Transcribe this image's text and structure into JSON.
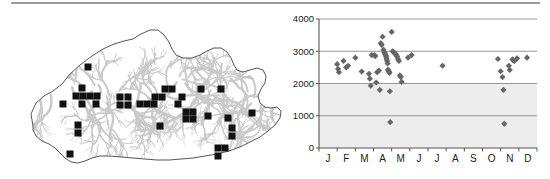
{
  "figure": {
    "panels": [
      "distribution-map",
      "altitude-month-scatter"
    ],
    "background_color": "#ffffff",
    "rule_color": "#9a9a9a"
  },
  "map": {
    "name": "Bhutan distribution map",
    "outline_color": "#555555",
    "relief_color": "#c9c9c9",
    "record_marker_color": "#111111",
    "record_marker_shape": "square",
    "record_marker_size": 7,
    "outline_path": "M 33 118 L 31 106 L 36 95 L 44 88 L 53 83 L 62 76 L 70 66 L 80 57 L 92 48 L 103 41 L 114 36 L 124 33 L 133 31 L 141 26 L 150 22 L 158 22 L 164 27 L 169 34 L 172 41 L 176 47 L 183 50 L 192 50 L 200 47 L 207 43 L 214 40 L 221 40 L 227 44 L 231 50 L 234 57 L 237 62 L 243 64 L 250 62 L 257 60 L 263 62 L 266 68 L 265 75 L 261 81 L 258 88 L 260 95 L 265 99 L 271 100 L 277 99 L 281 103 L 280 110 L 275 117 L 268 123 L 260 129 L 250 134 L 240 139 L 229 143 L 217 146 L 205 148 L 193 150 L 181 151 L 169 152 L 157 152 L 145 151 L 133 150 L 121 149 L 110 148 L 100 148 L 92 150 L 85 153 L 78 155 L 71 154 L 65 150 L 60 145 L 55 140 L 49 136 L 42 133 L 36 128 L 33 122 Z",
    "records": [
      {
        "x": 88,
        "y": 59
      },
      {
        "x": 82,
        "y": 80
      },
      {
        "x": 63,
        "y": 96
      },
      {
        "x": 76,
        "y": 88
      },
      {
        "x": 83,
        "y": 88
      },
      {
        "x": 90,
        "y": 88
      },
      {
        "x": 97,
        "y": 88
      },
      {
        "x": 82,
        "y": 96
      },
      {
        "x": 96,
        "y": 96
      },
      {
        "x": 78,
        "y": 117
      },
      {
        "x": 78,
        "y": 125
      },
      {
        "x": 70,
        "y": 146
      },
      {
        "x": 120,
        "y": 89
      },
      {
        "x": 128,
        "y": 89
      },
      {
        "x": 120,
        "y": 97
      },
      {
        "x": 128,
        "y": 97
      },
      {
        "x": 140,
        "y": 96
      },
      {
        "x": 147,
        "y": 96
      },
      {
        "x": 154,
        "y": 96
      },
      {
        "x": 155,
        "y": 89
      },
      {
        "x": 162,
        "y": 89
      },
      {
        "x": 160,
        "y": 118
      },
      {
        "x": 165,
        "y": 81
      },
      {
        "x": 172,
        "y": 81
      },
      {
        "x": 178,
        "y": 96
      },
      {
        "x": 182,
        "y": 89
      },
      {
        "x": 186,
        "y": 104
      },
      {
        "x": 193,
        "y": 104
      },
      {
        "x": 186,
        "y": 111
      },
      {
        "x": 193,
        "y": 111
      },
      {
        "x": 201,
        "y": 81
      },
      {
        "x": 208,
        "y": 108
      },
      {
        "x": 221,
        "y": 81
      },
      {
        "x": 228,
        "y": 110
      },
      {
        "x": 232,
        "y": 120
      },
      {
        "x": 232,
        "y": 128
      },
      {
        "x": 218,
        "y": 140
      },
      {
        "x": 225,
        "y": 140
      },
      {
        "x": 218,
        "y": 148
      },
      {
        "x": 252,
        "y": 105
      }
    ]
  },
  "chart_data": {
    "type": "scatter",
    "title": "",
    "xlabel": "",
    "ylabel": "",
    "xlim": [
      0,
      12
    ],
    "ylim": [
      0,
      4000
    ],
    "grid": true,
    "legend": null,
    "plot_background": "#ededed",
    "marker_color": "#666666",
    "marker_shape": "diamond",
    "y_ticks": [
      0,
      1000,
      2000,
      3000,
      4000
    ],
    "y_tick_labels": [
      "0",
      "1000",
      "2000",
      "3000",
      "4000"
    ],
    "x_tick_labels": [
      "J",
      "F",
      "M",
      "A",
      "M",
      "J",
      "J",
      "A",
      "S",
      "O",
      "N",
      "D"
    ],
    "x_tick_months": [
      "January",
      "February",
      "March",
      "April",
      "May",
      "June",
      "July",
      "August",
      "September",
      "October",
      "November",
      "December"
    ],
    "points": [
      {
        "month": 1.0,
        "value": 2600
      },
      {
        "month": 1.05,
        "value": 2450
      },
      {
        "month": 1.1,
        "value": 2350
      },
      {
        "month": 1.35,
        "value": 2700
      },
      {
        "month": 1.5,
        "value": 2500
      },
      {
        "month": 1.6,
        "value": 2550
      },
      {
        "month": 2.0,
        "value": 2800
      },
      {
        "month": 2.35,
        "value": 2370
      },
      {
        "month": 2.9,
        "value": 2880
      },
      {
        "month": 2.75,
        "value": 2300
      },
      {
        "month": 2.8,
        "value": 2150
      },
      {
        "month": 2.85,
        "value": 1930
      },
      {
        "month": 3.05,
        "value": 2880
      },
      {
        "month": 3.1,
        "value": 2850
      },
      {
        "month": 3.15,
        "value": 2030
      },
      {
        "month": 3.2,
        "value": 2350
      },
      {
        "month": 3.3,
        "value": 2400
      },
      {
        "month": 3.35,
        "value": 1800
      },
      {
        "month": 3.4,
        "value": 3250
      },
      {
        "month": 3.45,
        "value": 3200
      },
      {
        "month": 3.5,
        "value": 3450
      },
      {
        "month": 3.55,
        "value": 3050
      },
      {
        "month": 3.6,
        "value": 2970
      },
      {
        "month": 3.62,
        "value": 2940
      },
      {
        "month": 3.65,
        "value": 2900
      },
      {
        "month": 3.68,
        "value": 2860
      },
      {
        "month": 3.7,
        "value": 2820
      },
      {
        "month": 3.72,
        "value": 2760
      },
      {
        "month": 3.75,
        "value": 2700
      },
      {
        "month": 3.78,
        "value": 2620
      },
      {
        "month": 3.8,
        "value": 2430
      },
      {
        "month": 3.82,
        "value": 2400
      },
      {
        "month": 3.85,
        "value": 2370
      },
      {
        "month": 3.88,
        "value": 2330
      },
      {
        "month": 3.9,
        "value": 1760
      },
      {
        "month": 3.92,
        "value": 800
      },
      {
        "month": 4.0,
        "value": 3600
      },
      {
        "month": 4.05,
        "value": 3000
      },
      {
        "month": 4.1,
        "value": 2980
      },
      {
        "month": 4.15,
        "value": 2950
      },
      {
        "month": 4.2,
        "value": 2920
      },
      {
        "month": 4.25,
        "value": 2880
      },
      {
        "month": 4.3,
        "value": 2840
      },
      {
        "month": 4.35,
        "value": 2760
      },
      {
        "month": 4.4,
        "value": 2700
      },
      {
        "month": 4.45,
        "value": 2250
      },
      {
        "month": 4.5,
        "value": 2200
      },
      {
        "month": 4.55,
        "value": 2050
      },
      {
        "month": 4.9,
        "value": 2800
      },
      {
        "month": 5.1,
        "value": 2880
      },
      {
        "month": 6.8,
        "value": 2550
      },
      {
        "month": 9.85,
        "value": 2760
      },
      {
        "month": 10.0,
        "value": 2380
      },
      {
        "month": 10.1,
        "value": 2200
      },
      {
        "month": 10.15,
        "value": 1800
      },
      {
        "month": 10.2,
        "value": 750
      },
      {
        "month": 10.45,
        "value": 2550
      },
      {
        "month": 10.5,
        "value": 2420
      },
      {
        "month": 10.65,
        "value": 2750
      },
      {
        "month": 10.7,
        "value": 2720
      },
      {
        "month": 10.75,
        "value": 2700
      },
      {
        "month": 10.9,
        "value": 2780
      },
      {
        "month": 11.45,
        "value": 2800
      }
    ]
  }
}
